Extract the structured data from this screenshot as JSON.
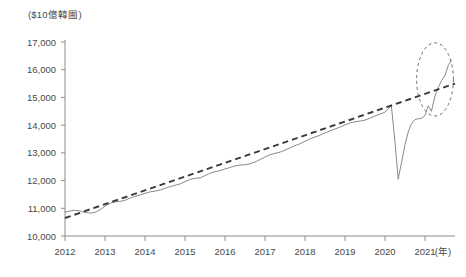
{
  "chart_data": {
    "type": "line",
    "title": "",
    "subtitle": "",
    "xlabel": "",
    "ylabel": "",
    "unit_label": "($10億韓圌)",
    "x_unit_label": "(年)",
    "xlim": [
      2012,
      2021.75
    ],
    "ylim": [
      10000,
      17000
    ],
    "y_ticks": [
      10000,
      11000,
      12000,
      13000,
      14000,
      15000,
      16000,
      17000
    ],
    "y_tick_labels": [
      "10,000",
      "11,000",
      "12,000",
      "13,000",
      "14,000",
      "15,000",
      "16,000",
      "17,000"
    ],
    "x_ticks": [
      2012,
      2013,
      2014,
      2015,
      2016,
      2017,
      2018,
      2019,
      2020,
      2021
    ],
    "x_tick_labels": [
      "2012",
      "2013",
      "2014",
      "2015",
      "2016",
      "2017",
      "2018",
      "2019",
      "2020",
      "2021"
    ],
    "grid": false,
    "legend": "none",
    "series": [
      {
        "name": "actual",
        "style": "solid",
        "color": "#8a8a8a",
        "x": [
          2012.0,
          2012.12,
          2012.25,
          2012.38,
          2012.5,
          2012.62,
          2012.75,
          2012.88,
          2013.0,
          2013.12,
          2013.25,
          2013.38,
          2013.5,
          2013.62,
          2013.75,
          2013.88,
          2014.0,
          2014.12,
          2014.25,
          2014.38,
          2014.5,
          2014.62,
          2014.75,
          2014.88,
          2015.0,
          2015.12,
          2015.25,
          2015.38,
          2015.5,
          2015.62,
          2015.75,
          2015.88,
          2016.0,
          2016.12,
          2016.25,
          2016.38,
          2016.5,
          2016.62,
          2016.75,
          2016.88,
          2017.0,
          2017.12,
          2017.25,
          2017.38,
          2017.5,
          2017.62,
          2017.75,
          2017.88,
          2018.0,
          2018.12,
          2018.25,
          2018.38,
          2018.5,
          2018.62,
          2018.75,
          2018.88,
          2019.0,
          2019.12,
          2019.25,
          2019.38,
          2019.5,
          2019.62,
          2019.75,
          2019.88,
          2020.0,
          2020.08,
          2020.16,
          2020.25,
          2020.33,
          2020.42,
          2020.5,
          2020.58,
          2020.66,
          2020.75,
          2020.83,
          2020.92,
          2021.0,
          2021.08,
          2021.16,
          2021.25,
          2021.33,
          2021.42,
          2021.5,
          2021.58,
          2021.66
        ],
        "y": [
          10860,
          10900,
          10930,
          10900,
          10850,
          10830,
          10850,
          10950,
          11080,
          11180,
          11230,
          11250,
          11290,
          11360,
          11430,
          11480,
          11540,
          11590,
          11620,
          11660,
          11720,
          11780,
          11830,
          11880,
          11960,
          12040,
          12080,
          12100,
          12180,
          12260,
          12320,
          12360,
          12420,
          12470,
          12530,
          12560,
          12570,
          12600,
          12670,
          12760,
          12850,
          12930,
          12980,
          13030,
          13100,
          13180,
          13260,
          13330,
          13420,
          13500,
          13570,
          13640,
          13720,
          13790,
          13860,
          13930,
          14010,
          14080,
          14120,
          14150,
          14180,
          14250,
          14330,
          14400,
          14470,
          14600,
          14680,
          13400,
          12050,
          12700,
          13300,
          13750,
          14050,
          14200,
          14230,
          14250,
          14350,
          14700,
          14500,
          15050,
          15350,
          15620,
          15800,
          16150,
          16350
        ]
      },
      {
        "name": "trend",
        "style": "dashed",
        "color": "#3a3a3a",
        "x": [
          2012.0,
          2021.75
        ],
        "y": [
          10650,
          15500
        ]
      }
    ],
    "annotations": [
      {
        "type": "ellipse",
        "name": "recovery-highlight",
        "center_x": 2021.25,
        "center_y": 15650,
        "radius_x_years": 0.46,
        "radius_y_value": 1320,
        "style": "dashed",
        "color": "#6b6b6b"
      }
    ]
  }
}
